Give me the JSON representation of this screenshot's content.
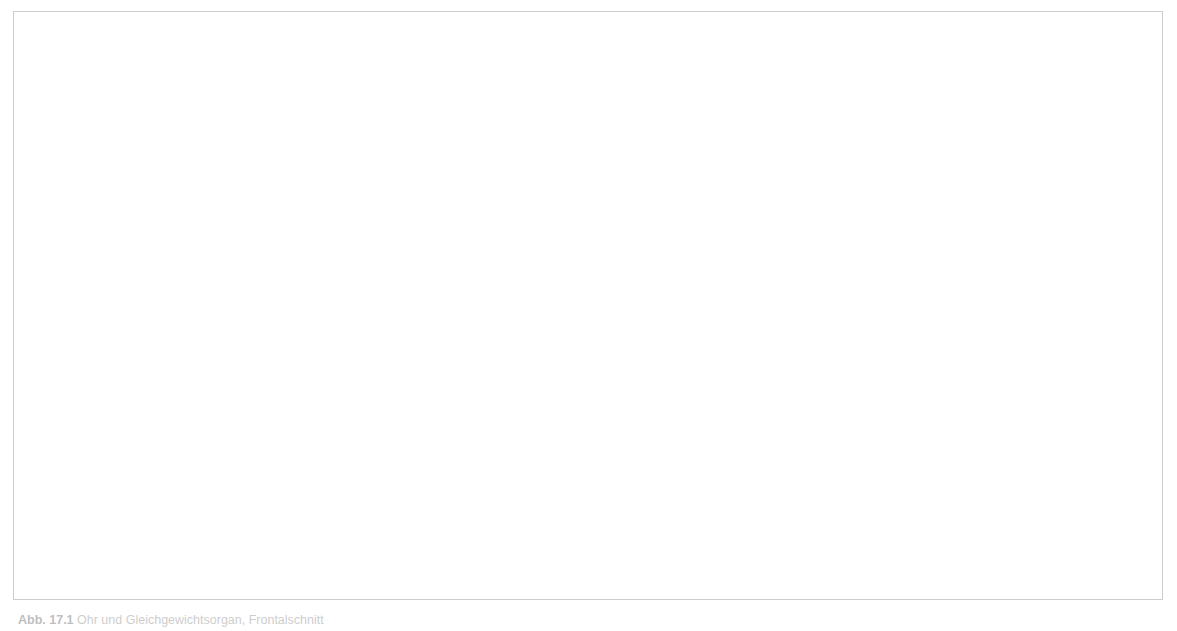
{
  "figure": {
    "border_color": "#cdcdcd",
    "background_color": "#ffffff",
    "leader_line_color": "#55555a",
    "label_text_color": "#1d1d1d"
  },
  "palette": {
    "skin_light": "#f0c3a8",
    "skin_mid": "#e2a184",
    "skin_dark": "#c9795c",
    "cartilage_cream": "#ece1c0",
    "bone_tan": "#d6cba3",
    "bone_tan_dark": "#bfb289",
    "spongy_bone": "#f6f1e4",
    "canal_brown": "#8a5a46",
    "cavity_dark": "#4a2418",
    "muscle_red": "#b5654c",
    "tube_white": "#e9eaec",
    "highlight_yellow": "#e9e6a8",
    "labyrinth_grey": "#d8d5cb"
  },
  "labels": [
    {
      "id": "canalis-semicircularis-posterior",
      "lines": [
        "Canalis",
        "semicircularis",
        "posterior"
      ],
      "align": "center",
      "x": 474,
      "y": 33,
      "w": 150
    },
    {
      "id": "canalis-semicircularis-lateralis",
      "lines": [
        "Canalis",
        "semicircularis",
        "lateralis"
      ],
      "align": "center",
      "x": 604,
      "y": 33,
      "w": 150
    },
    {
      "id": "canalis-semicircularis-anterior",
      "lines": [
        "Canalis",
        "semicircularis",
        "anterior"
      ],
      "align": "center",
      "x": 731,
      "y": 33,
      "w": 150
    },
    {
      "id": "vestibulum",
      "lines": [
        "Vestibulum"
      ],
      "align": "left",
      "x": 840,
      "y": 117,
      "w": 160
    },
    {
      "id": "n-vestibularis",
      "lines": [
        "N. vestibularis"
      ],
      "align": "left",
      "x": 852,
      "y": 150,
      "w": 170
    },
    {
      "id": "n-cochlearis",
      "lines": [
        "N. cochlearis"
      ],
      "align": "left",
      "x": 858,
      "y": 180,
      "w": 170
    },
    {
      "id": "cochlea",
      "lines": [
        "Cochlea"
      ],
      "align": "left",
      "x": 906,
      "y": 214,
      "w": 150
    },
    {
      "id": "malleus-caput",
      "lines": [
        "Malleus,",
        "Caput"
      ],
      "align": "left",
      "x": 906,
      "y": 247,
      "w": 150
    },
    {
      "id": "felsenbein",
      "lines": [
        "Felsenbein"
      ],
      "align": "left",
      "x": 873,
      "y": 290,
      "w": 160
    },
    {
      "id": "stapes",
      "lines": [
        "Stapes"
      ],
      "align": "left",
      "x": 862,
      "y": 325,
      "w": 150
    },
    {
      "id": "m-tensor-tympani",
      "lines": [
        "M. tensor",
        "tympani"
      ],
      "align": "left",
      "x": 862,
      "y": 356,
      "w": 150
    },
    {
      "id": "tuba-auditiva",
      "lines": [
        "Tuba",
        "auditiva"
      ],
      "align": "left",
      "x": 888,
      "y": 405,
      "w": 150
    },
    {
      "id": "cavitas-tympani",
      "lines": [
        "Cavitas",
        "tympani"
      ],
      "align": "left",
      "x": 684,
      "y": 399,
      "w": 130
    },
    {
      "id": "membrana-tympanica",
      "lines": [
        "Membrana",
        "tympanica"
      ],
      "align": "left",
      "x": 636,
      "y": 453,
      "w": 150
    },
    {
      "id": "proc-styloideus",
      "lines": [
        "Proc.",
        "styloideus"
      ],
      "align": "left",
      "x": 661,
      "y": 508,
      "w": 140
    },
    {
      "id": "incus",
      "lines": [
        "Incus"
      ],
      "align": "left",
      "x": 552,
      "y": 453,
      "w": 90
    },
    {
      "id": "meatus-acusticus-externus",
      "lines": [
        "Meatus acusticus",
        "externus"
      ],
      "align": "center",
      "x": 415,
      "y": 540,
      "w": 220
    }
  ],
  "leader_lines": [
    {
      "id": "leader-csc-posterior",
      "x1": 549,
      "y1": 110,
      "x2": 594,
      "y2": 214
    },
    {
      "id": "leader-csc-lateralis",
      "x1": 617,
      "y1": 110,
      "x2": 612,
      "y2": 207
    },
    {
      "id": "leader-csc-anterior",
      "x1": 724,
      "y1": 110,
      "x2": 643,
      "y2": 201
    },
    {
      "id": "leader-vestibulum",
      "x1": 836,
      "y1": 136,
      "x2": 673,
      "y2": 238
    },
    {
      "id": "leader-n-vestibularis",
      "x1": 849,
      "y1": 160,
      "x2": 716,
      "y2": 215
    },
    {
      "id": "leader-n-cochlearis",
      "x1": 854,
      "y1": 190,
      "x2": 825,
      "y2": 198
    },
    {
      "id": "leader-cochlea",
      "x1": 900,
      "y1": 224,
      "x2": 688,
      "y2": 240
    },
    {
      "id": "leader-malleus-caput",
      "x1": 900,
      "y1": 264,
      "x2": 614,
      "y2": 258
    },
    {
      "id": "leader-felsenbein",
      "x1": 868,
      "y1": 299,
      "x2": 818,
      "y2": 288
    },
    {
      "id": "leader-stapes",
      "x1": 857,
      "y1": 335,
      "x2": 616,
      "y2": 264
    },
    {
      "id": "leader-m-tensor-tympani",
      "x1": 857,
      "y1": 366,
      "x2": 770,
      "y2": 355
    },
    {
      "id": "leader-tuba-auditiva",
      "x1": 883,
      "y1": 415,
      "x2": 798,
      "y2": 406
    },
    {
      "id": "leader-cavitas-tympani",
      "x1": 700,
      "y1": 388,
      "x2": 621,
      "y2": 272
    },
    {
      "id": "leader-membrana-tympanica",
      "x1": 660,
      "y1": 442,
      "x2": 600,
      "y2": 295
    },
    {
      "id": "leader-proc-styloideus",
      "x1": 655,
      "y1": 518,
      "x2": 617,
      "y2": 518
    },
    {
      "id": "leader-incus",
      "x1": 575,
      "y1": 443,
      "x2": 573,
      "y2": 251
    },
    {
      "id": "leader-meatus-acusticus-externus",
      "x1": 472,
      "y1": 531,
      "x2": 438,
      "y2": 320
    }
  ],
  "caption": {
    "number": "Abb. 17.1",
    "text": "Ohr und Gleichgewichtsorgan, Frontalschnitt"
  }
}
